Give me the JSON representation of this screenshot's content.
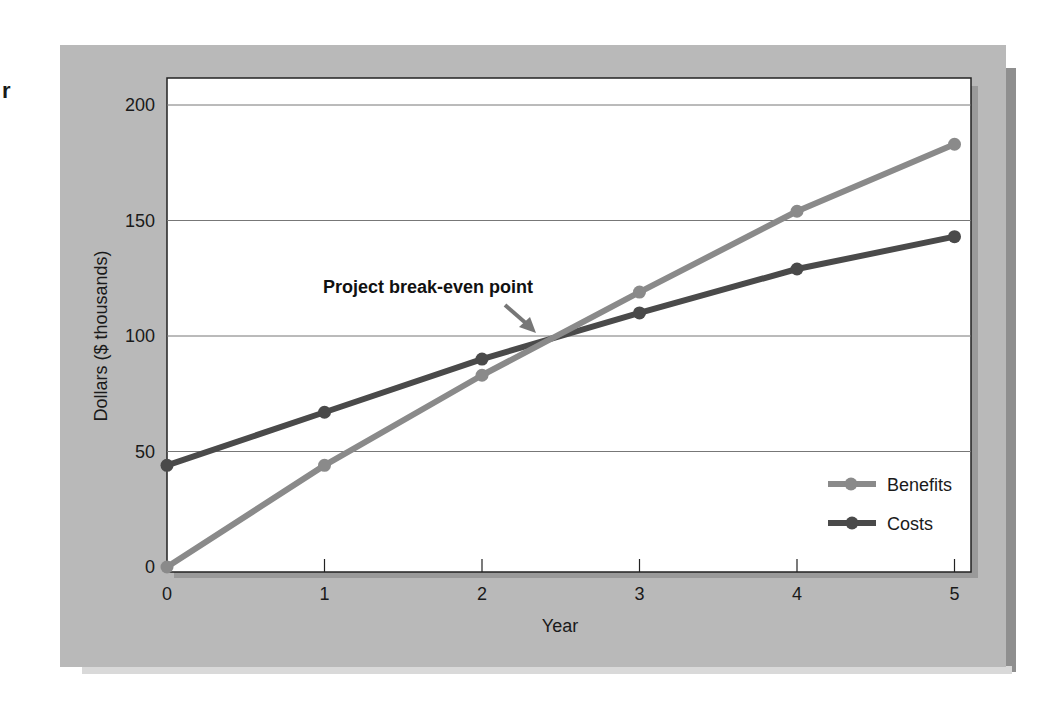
{
  "page": {
    "stray_char": "r"
  },
  "chart_data": {
    "type": "line",
    "title": "",
    "xlabel": "Year",
    "ylabel": "Dollars ($ thousands)",
    "x": [
      0,
      1,
      2,
      3,
      4,
      5
    ],
    "x_ticks": [
      "0",
      "1",
      "2",
      "3",
      "4",
      "5"
    ],
    "y_ticks": [
      "0",
      "50",
      "100",
      "150",
      "200"
    ],
    "ylim": [
      0,
      200
    ],
    "xlim": [
      0,
      5
    ],
    "grid": "horizontal",
    "legend_position": "lower right",
    "series": [
      {
        "name": "Benefits",
        "color": "#8a8a8a",
        "values": [
          0,
          44,
          83,
          119,
          154,
          183
        ]
      },
      {
        "name": "Costs",
        "color": "#4a4a4a",
        "values": [
          44,
          67,
          90,
          110,
          129,
          143
        ]
      }
    ],
    "annotations": [
      {
        "text": "Project break-even point",
        "x": 2.45,
        "y": 98,
        "arrow": true
      }
    ]
  }
}
